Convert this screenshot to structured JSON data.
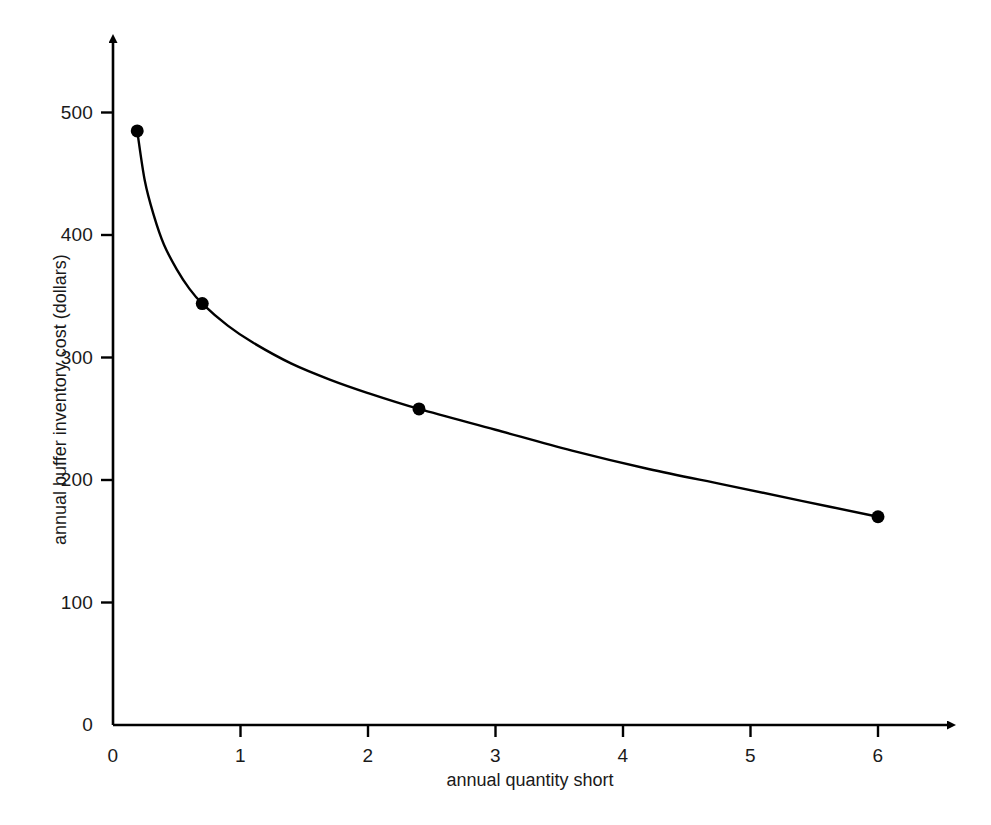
{
  "chart_data": {
    "type": "line",
    "title": "",
    "subtitle": "",
    "xlabel": "annual quantity short",
    "ylabel": "annual buffer inventory cost (dollars)",
    "xlim": [
      0,
      6.6
    ],
    "ylim": [
      0,
      560
    ],
    "grid": false,
    "legend": null,
    "marker": "filled-circle",
    "line_color": "#000000",
    "marker_color": "#000000",
    "axis_color": "#000000",
    "background_color": "#ffffff",
    "x_ticks": [
      {
        "value": 0,
        "label": "0"
      },
      {
        "value": 1,
        "label": "1"
      },
      {
        "value": 2,
        "label": "2"
      },
      {
        "value": 3,
        "label": "3"
      },
      {
        "value": 4,
        "label": "4"
      },
      {
        "value": 5,
        "label": "5"
      },
      {
        "value": 6,
        "label": "6"
      }
    ],
    "y_ticks": [
      {
        "value": 0,
        "label": "0"
      },
      {
        "value": 100,
        "label": "100"
      },
      {
        "value": 200,
        "label": "200"
      },
      {
        "value": 300,
        "label": "300"
      },
      {
        "value": 400,
        "label": "400"
      },
      {
        "value": 500,
        "label": "500"
      }
    ],
    "series": [
      {
        "name": "annual buffer inventory cost",
        "x": [
          0.19,
          0.7,
          2.4,
          6.0
        ],
        "values": [
          485,
          344,
          258,
          170
        ],
        "points": [
          {
            "x": 0.19,
            "y": 485
          },
          {
            "x": 0.7,
            "y": 344
          },
          {
            "x": 2.4,
            "y": 258
          },
          {
            "x": 6.0,
            "y": 170
          }
        ]
      }
    ],
    "curve_path_points": [
      {
        "x": 0.19,
        "y": 485
      },
      {
        "x": 0.25,
        "y": 444
      },
      {
        "x": 0.32,
        "y": 416
      },
      {
        "x": 0.4,
        "y": 392
      },
      {
        "x": 0.5,
        "y": 372
      },
      {
        "x": 0.6,
        "y": 356
      },
      {
        "x": 0.7,
        "y": 344
      },
      {
        "x": 0.9,
        "y": 326
      },
      {
        "x": 1.1,
        "y": 312
      },
      {
        "x": 1.4,
        "y": 295
      },
      {
        "x": 1.7,
        "y": 282
      },
      {
        "x": 2.0,
        "y": 271
      },
      {
        "x": 2.4,
        "y": 258
      },
      {
        "x": 3.0,
        "y": 241
      },
      {
        "x": 3.6,
        "y": 224
      },
      {
        "x": 4.2,
        "y": 209
      },
      {
        "x": 4.8,
        "y": 196
      },
      {
        "x": 5.4,
        "y": 183
      },
      {
        "x": 6.0,
        "y": 170
      }
    ]
  },
  "axes_icons": {
    "x_arrow": "arrow-right-icon",
    "y_arrow": "arrow-up-icon"
  }
}
